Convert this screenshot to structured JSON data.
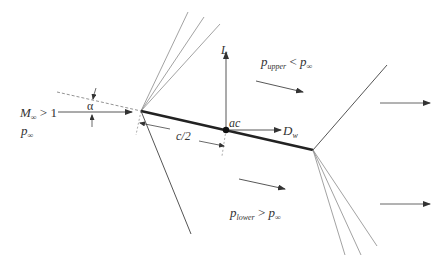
{
  "diagram": {
    "labels": {
      "mach": {
        "main": "M",
        "sub": "∞",
        "rel": " > 1"
      },
      "p_inf": {
        "main": "p",
        "sub": "∞"
      },
      "alpha": "α",
      "lift": "L",
      "ac": "ac",
      "wave_drag": {
        "main": "D",
        "sub": "w"
      },
      "chord_half": "c/2",
      "p_upper": {
        "main": "p",
        "sub": "upper",
        "rel": " < ",
        "main2": "p",
        "sub2": "∞"
      },
      "p_lower": {
        "main": "p",
        "sub": "lower",
        "rel": " > ",
        "main2": "p",
        "sub2": "∞"
      }
    },
    "colors": {
      "plate": "#222222",
      "line": "#555555",
      "fan": "#888888",
      "text": "#333333"
    },
    "geometry": {
      "leading_edge": [
        141,
        111
      ],
      "trailing_edge": [
        313,
        150
      ],
      "aerodynamic_center": [
        226,
        130
      ]
    }
  }
}
